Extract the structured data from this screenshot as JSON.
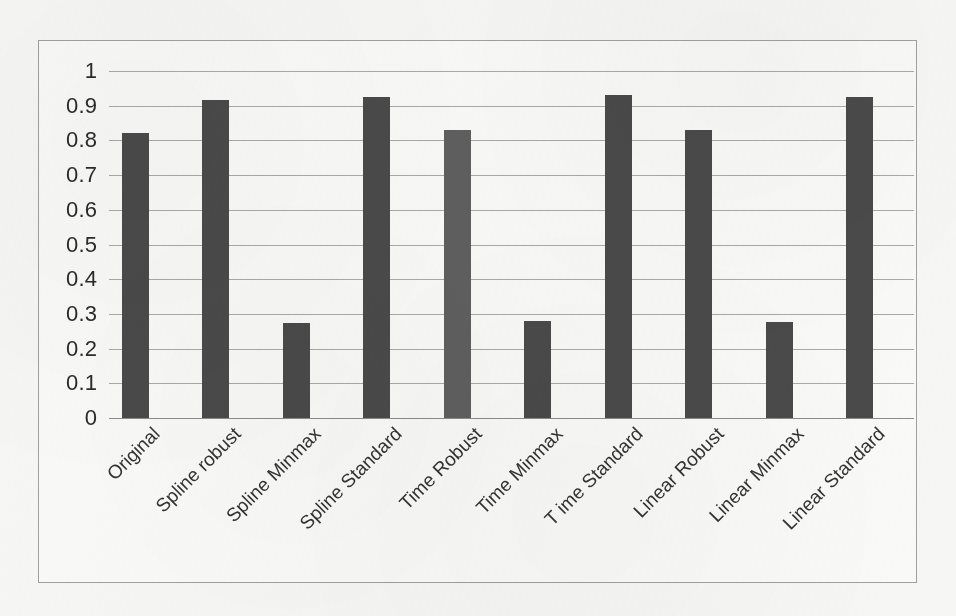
{
  "chart_data": {
    "type": "bar",
    "title": "",
    "subtitle": "",
    "xlabel": "",
    "ylabel": "",
    "ylim": [
      0,
      1
    ],
    "yticks": [
      "1",
      "0.9",
      "0.8",
      "0.7",
      "0.6",
      "0.5",
      "0.4",
      "0.3",
      "0.2",
      "0.1",
      "0"
    ],
    "ytick_values": [
      1,
      0.9,
      0.8,
      0.7,
      0.6,
      0.5,
      0.4,
      0.3,
      0.2,
      0.1,
      0
    ],
    "grid": true,
    "legend": "none",
    "categories": [
      "Original",
      "Spline robust",
      "Spline Minmax",
      "Spline Standard",
      "Time Robust",
      "Time Minmax",
      "T ime Standard",
      "Linear Robust",
      "Linear Minmax",
      "Linear Standard"
    ],
    "values": [
      0.82,
      0.915,
      0.275,
      0.925,
      0.83,
      0.28,
      0.93,
      0.83,
      0.278,
      0.925
    ],
    "bar_colors": [
      "#4a4a4a",
      "#4a4a4a",
      "#4a4a4a",
      "#4a4a4a",
      "#5f5f5f",
      "#4a4a4a",
      "#4a4a4a",
      "#4a4a4a",
      "#4a4a4a",
      "#4a4a4a"
    ]
  },
  "style": {
    "background_color": "#f6f6f4",
    "frame_border_color": "#9fa1a0",
    "gridline_color": "#a8aaa9",
    "bar_color": "#4a4a4a",
    "bar_color_highlight": "#5f5f5f",
    "tick_text_color": "#2b2b2b"
  }
}
